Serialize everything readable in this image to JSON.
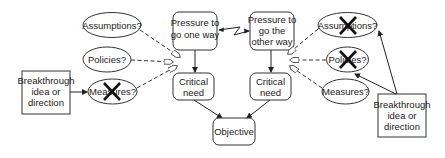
{
  "diagram": {
    "left": {
      "pressure": [
        "Pressure to",
        "go one way"
      ],
      "critical_need": [
        "Critical",
        "need"
      ],
      "assumptions": "Assumptions?",
      "policies": "Policies?",
      "measures": "Measures?",
      "breakthrough": [
        "Breakthrough",
        "idea or",
        "direction"
      ],
      "crossed_out": "measures"
    },
    "right": {
      "pressure": [
        "Pressure to",
        "go the",
        "other way"
      ],
      "critical_need": [
        "Critical",
        "need"
      ],
      "assumptions": "Assumptions?",
      "policies": "Policies?",
      "measures": "Measures?",
      "breakthrough": [
        "Breakthrough",
        "idea or",
        "direction"
      ],
      "crossed_out": [
        "assumptions",
        "policies"
      ]
    },
    "objective": "Objective",
    "conflict_icon": "lightning-zigzag-icon",
    "colors": {
      "stroke": "#333333",
      "fill": "#ffffff",
      "text": "#222222"
    }
  }
}
